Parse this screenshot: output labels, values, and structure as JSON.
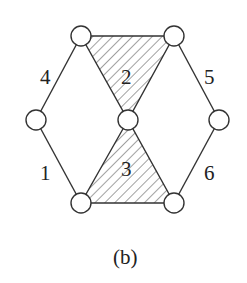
{
  "figure": {
    "caption": "(b)",
    "nodes": [
      {
        "id": "top-left",
        "x": 81,
        "y": 36
      },
      {
        "id": "top-right",
        "x": 174,
        "y": 36
      },
      {
        "id": "left",
        "x": 36,
        "y": 120
      },
      {
        "id": "center",
        "x": 128,
        "y": 120
      },
      {
        "id": "right",
        "x": 219,
        "y": 120
      },
      {
        "id": "bottom-left",
        "x": 81,
        "y": 203
      },
      {
        "id": "bottom-right",
        "x": 174,
        "y": 203
      }
    ],
    "labels": {
      "l1": "1",
      "l2": "2",
      "l3": "3",
      "l4": "4",
      "l5": "5",
      "l6": "6"
    },
    "shaded_regions": [
      "2",
      "3"
    ]
  }
}
